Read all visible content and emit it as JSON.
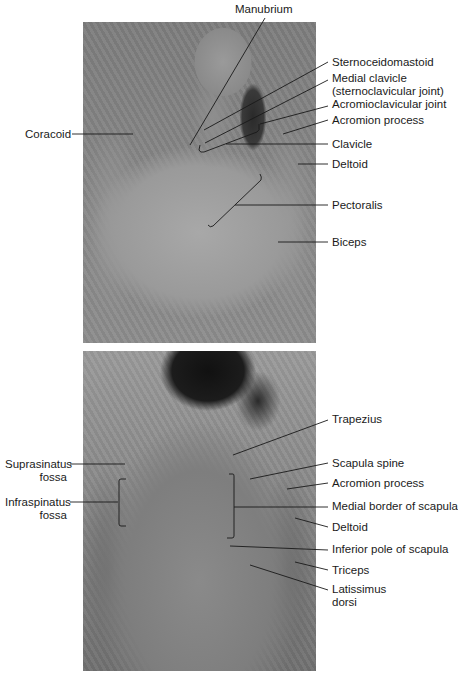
{
  "figure": {
    "top_panel": {
      "view": "anterior",
      "labels": [
        {
          "id": "manubrium",
          "text": "Manubrium"
        },
        {
          "id": "sternoceidomastoid",
          "text": "Sternoceidomastoid"
        },
        {
          "id": "medial-clavicle",
          "line1": "Medial clavicle",
          "line2": "(sternoclavicular joint)"
        },
        {
          "id": "acromioclavicular-joint",
          "text": "Acromioclavicular joint"
        },
        {
          "id": "acromion-process",
          "text": "Acromion process"
        },
        {
          "id": "coracoid",
          "text": "Coracoid"
        },
        {
          "id": "clavicle",
          "text": "Clavicle"
        },
        {
          "id": "deltoid",
          "text": "Deltoid"
        },
        {
          "id": "pectoralis",
          "text": "Pectoralis"
        },
        {
          "id": "biceps",
          "text": "Biceps"
        }
      ]
    },
    "bottom_panel": {
      "view": "posterior",
      "labels": [
        {
          "id": "trapezius",
          "text": "Trapezius"
        },
        {
          "id": "suprasinatus-fossa",
          "line1": "Suprasinatus",
          "line2": "fossa"
        },
        {
          "id": "scapula-spine",
          "text": "Scapula spine"
        },
        {
          "id": "acromion-process",
          "text": "Acromion process"
        },
        {
          "id": "infraspinatus-fossa",
          "line1": "Infraspinatus",
          "line2": "fossa"
        },
        {
          "id": "medial-border-of-scapula",
          "text": "Medial border of scapula"
        },
        {
          "id": "deltoid",
          "text": "Deltoid"
        },
        {
          "id": "inferior-pole-of-scapula",
          "text": "Inferior pole of scapula"
        },
        {
          "id": "triceps",
          "text": "Triceps"
        },
        {
          "id": "latissimus-dorsi",
          "line1": "Latissimus",
          "line2": "dorsi"
        }
      ]
    }
  }
}
